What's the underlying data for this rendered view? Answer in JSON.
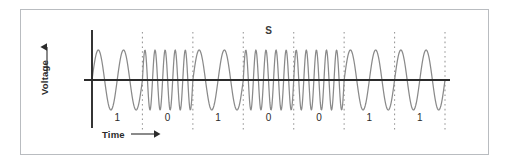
{
  "figure": {
    "title_annotation": "S",
    "axes": {
      "y_label": "Voltage",
      "y_arrow": "up-arrow",
      "x_label": "Time",
      "x_arrow": "right-arrow"
    },
    "colors": {
      "frame": "#b9bcc0",
      "axis": "#2b2b2b",
      "waveform": "#8a8a8a",
      "gridline": "#9a9a9a",
      "text": "#2b2b2b",
      "background": "#ffffff"
    }
  },
  "chart_data": {
    "type": "line",
    "title": "S",
    "xlabel": "Time",
    "ylabel": "Voltage",
    "subtitle": "",
    "grid": true,
    "grid_style": "dashed-vertical-bit-boundaries",
    "legend": "none",
    "modulation": "FSK",
    "categories": [
      "1",
      "0",
      "1",
      "0",
      "0",
      "1",
      "1"
    ],
    "bit_labels": [
      "1",
      "0",
      "1",
      "0",
      "0",
      "1",
      "1"
    ],
    "values": [
      1,
      0,
      1,
      0,
      0,
      1,
      1
    ],
    "cycles_per_bit": [
      2,
      5,
      2,
      5,
      5,
      2,
      2
    ],
    "symbol_frequency_map": {
      "1": 2,
      "0": 5
    },
    "amplitude": 1.0,
    "xlim": [
      0,
      7
    ],
    "ylim": [
      -1.15,
      1.15
    ],
    "bit_boundaries_x": [
      0,
      1,
      2,
      3,
      4,
      5,
      6,
      7
    ],
    "axis_origin_x": 0,
    "baseline_y": 0,
    "annotations": [
      {
        "text": "S",
        "x": 3.5,
        "y": 1.35
      }
    ]
  }
}
